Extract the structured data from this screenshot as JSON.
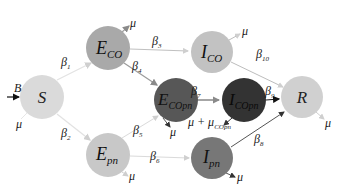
{
  "diagram": {
    "type": "compartmental-model",
    "nodes": [
      {
        "id": "S",
        "main": "S",
        "sub": "",
        "x": 42,
        "y": 97,
        "r": 22,
        "fill": "#dadada",
        "text": "#222222"
      },
      {
        "id": "E_CO",
        "main": "E",
        "sub": "CO",
        "x": 108,
        "y": 48,
        "r": 22,
        "fill": "#a9a9a9",
        "text": "#111111"
      },
      {
        "id": "I_CO",
        "main": "I",
        "sub": "CO",
        "x": 212,
        "y": 52,
        "r": 21,
        "fill": "#c2c2c2",
        "text": "#111111"
      },
      {
        "id": "E_COpn",
        "main": "E",
        "sub": "COpn",
        "x": 176,
        "y": 100,
        "r": 22,
        "fill": "#575757",
        "text": "#111111"
      },
      {
        "id": "I_COpn",
        "main": "I",
        "sub": "COpn",
        "x": 244,
        "y": 100,
        "r": 22,
        "fill": "#333333",
        "text": "#0a0a0a"
      },
      {
        "id": "R",
        "main": "R",
        "sub": "",
        "x": 302,
        "y": 97,
        "r": 21,
        "fill": "#d0d0d0",
        "text": "#222222"
      },
      {
        "id": "E_pn",
        "main": "E",
        "sub": "pn",
        "x": 108,
        "y": 155,
        "r": 22,
        "fill": "#c8c8c8",
        "text": "#111111"
      },
      {
        "id": "I_pn",
        "main": "I",
        "sub": "pn",
        "x": 212,
        "y": 158,
        "r": 21,
        "fill": "#777777",
        "text": "#111111"
      }
    ],
    "edges": [
      {
        "from": "S",
        "to": "E_CO",
        "label": "β",
        "sub": "1",
        "color": "#e0e0e0"
      },
      {
        "from": "S",
        "to": "E_pn",
        "label": "β",
        "sub": "2",
        "color": "#e0e0e0"
      },
      {
        "from": "E_CO",
        "to": "I_CO",
        "label": "β",
        "sub": "3",
        "color": "#bdbdbd"
      },
      {
        "from": "E_CO",
        "to": "E_COpn",
        "label": "β",
        "sub": "4",
        "color": "#9a9a9a"
      },
      {
        "from": "E_pn",
        "to": "E_COpn",
        "label": "β",
        "sub": "5",
        "color": "#d6d6d6"
      },
      {
        "from": "E_pn",
        "to": "I_pn",
        "label": "β",
        "sub": "6",
        "color": "#d6d6d6"
      },
      {
        "from": "E_COpn",
        "to": "I_COpn",
        "label": "β",
        "sub": "7",
        "color": "#6a6a6a"
      },
      {
        "from": "I_pn",
        "to": "R",
        "label": "β",
        "sub": "8",
        "color": "#555555"
      },
      {
        "from": "I_COpn",
        "to": "R",
        "label": "β",
        "sub": "9",
        "color": "#222222"
      },
      {
        "from": "I_CO",
        "to": "R",
        "label": "β",
        "sub": "10",
        "color": "#bdbdbd"
      }
    ],
    "inflow": {
      "label": "B",
      "to": "S"
    },
    "outflows": [
      {
        "from": "S",
        "label": "μ"
      },
      {
        "from": "E_CO",
        "label": "μ"
      },
      {
        "from": "I_CO",
        "label": "μ"
      },
      {
        "from": "E_COpn",
        "label": "μ"
      },
      {
        "from": "I_COpn",
        "label": "μ + μ",
        "sub": "COpn"
      },
      {
        "from": "R",
        "label": "μ"
      },
      {
        "from": "E_pn",
        "label": "μ"
      },
      {
        "from": "I_pn",
        "label": "μ"
      }
    ]
  },
  "labels": {
    "B": "B",
    "beta": "β",
    "mu": "μ",
    "mu_plus": "μ + μ",
    "sub_COpn": "COpn",
    "S": "S",
    "R": "R",
    "E": "E",
    "I": "I",
    "sub_CO": "CO",
    "sub_pn": "pn",
    "b1": "1",
    "b2": "2",
    "b3": "3",
    "b4": "4",
    "b5": "5",
    "b6": "6",
    "b7": "7",
    "b8": "8",
    "b9": "9",
    "b10": "10"
  }
}
